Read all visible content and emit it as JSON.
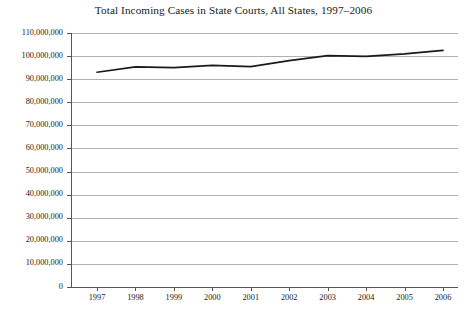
{
  "chart_data": {
    "type": "line",
    "title": "Total Incoming Cases in State Courts, All States, 1997–2006",
    "xlabel": "",
    "ylabel": "",
    "categories": [
      "1997",
      "1998",
      "1999",
      "2000",
      "2001",
      "2002",
      "2003",
      "2004",
      "2005",
      "2006"
    ],
    "x": [
      1997,
      1998,
      1999,
      2000,
      2001,
      2002,
      2003,
      2004,
      2005,
      2006
    ],
    "values": [
      93000000,
      95300000,
      95000000,
      96000000,
      95400000,
      98000000,
      100200000,
      99900000,
      101000000,
      102500000
    ],
    "series": [
      {
        "name": "Total Incoming Cases",
        "values": [
          93000000,
          95300000,
          95000000,
          96000000,
          95400000,
          98000000,
          100200000,
          99900000,
          101000000,
          102500000
        ]
      }
    ],
    "ylim": [
      0,
      110000000
    ],
    "ytick_values": [
      0,
      10000000,
      20000000,
      30000000,
      40000000,
      50000000,
      60000000,
      70000000,
      80000000,
      90000000,
      100000000,
      110000000
    ],
    "ytick_labels": [
      "0",
      "10,000,000",
      "20,000,000",
      "30,000,000",
      "40,000,000",
      "50,000,000",
      "60,000,000",
      "70,000,000",
      "80,000,000",
      "90,000,000",
      "100,000,000",
      "110,000,000"
    ],
    "xtick_labels": [
      "1997",
      "1998",
      "1999",
      "2000",
      "2001",
      "2002",
      "2003",
      "2004",
      "2005",
      "2006"
    ],
    "grid": true,
    "grid_axis": "y",
    "legend": false,
    "legend_position": "none",
    "line_color": "#1a1a1a",
    "grid_color": "#b0b0b0",
    "axis_color": "#555555",
    "background_color": "#ffffff",
    "annotations": []
  }
}
